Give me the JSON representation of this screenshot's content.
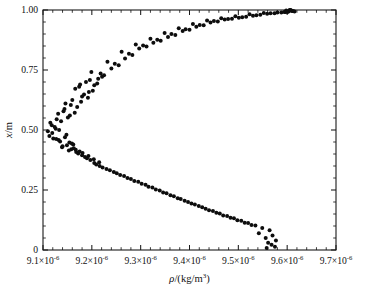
{
  "figure": {
    "width": 365,
    "height": 292,
    "background": "#ffffff",
    "marker_color": "#0d0d0d",
    "axis_color": "#1a1a1a"
  },
  "chart_data": {
    "type": "scatter",
    "title": "",
    "subtitle": "",
    "xlabel": "ρ/(kg/m³)",
    "ylabel": "x/m",
    "xlabel_parts": {
      "symbol": "ρ",
      "slash": "/(kg/m",
      "sup": "3",
      "close": ")"
    },
    "ylabel_parts": {
      "symbol": "x",
      "slash": "/m"
    },
    "grid": false,
    "legend": null,
    "xlim": [
      9.1e-06,
      9.7e-06
    ],
    "ylim": [
      0,
      1.0
    ],
    "xticks": [
      9.1e-06,
      9.2e-06,
      9.3e-06,
      9.4e-06,
      9.5e-06,
      9.6e-06,
      9.7e-06
    ],
    "xticklabels": [
      "9.1×10⁻⁶",
      "9.2×10⁻⁶",
      "9.3×10⁻⁶",
      "9.4×10⁻⁶",
      "9.5×10⁻⁶",
      "9.6×10⁻⁶",
      "9.7×10⁻⁶"
    ],
    "xtick_mantissas": [
      "9.1",
      "9.2",
      "9.3",
      "9.4",
      "9.5",
      "9.6",
      "9.7"
    ],
    "xtick_exponent": "-6",
    "xtick_base": "×10",
    "x_minor_per_major": 5,
    "yticks": [
      0,
      0.25,
      0.5,
      0.75,
      1.0
    ],
    "yticklabels": [
      "0",
      "0.25",
      "0.50",
      "0.75",
      "1.00"
    ],
    "y_minor_per_major": 5,
    "tick_direction": "in",
    "frame": "box",
    "marker": "filled-circle",
    "marker_size_px": 2.0,
    "series": [
      {
        "name": "density profile",
        "x": [
          9.155,
          9.128,
          9.142,
          9.17,
          9.118,
          9.146,
          9.16,
          9.133,
          9.18,
          9.194,
          9.166,
          9.205,
          9.188,
          9.213,
          9.176,
          9.225,
          9.199,
          9.24,
          9.218,
          9.255,
          9.232,
          9.268,
          9.247,
          9.283,
          9.261,
          9.297,
          9.276,
          9.312,
          9.29,
          9.326,
          9.305,
          9.341,
          9.32,
          9.356,
          9.334,
          9.371,
          9.349,
          9.386,
          9.363,
          9.4,
          9.378,
          9.414,
          9.392,
          9.429,
          9.407,
          9.443,
          9.421,
          9.458,
          9.436,
          9.472,
          9.45,
          9.487,
          9.465,
          9.501,
          9.479,
          9.516,
          9.494,
          9.53,
          9.508,
          9.545,
          9.523,
          9.559,
          9.537,
          9.574,
          9.552,
          9.588,
          9.566,
          9.596,
          9.58,
          9.603,
          9.594,
          9.61,
          9.601,
          9.608,
          9.612,
          9.605,
          9.598,
          9.615,
          9.607,
          9.6,
          9.148,
          9.121,
          9.135,
          9.162,
          9.11,
          9.139,
          9.153,
          9.126,
          9.172,
          9.186,
          9.158,
          9.197,
          9.18,
          9.205,
          9.168,
          9.216,
          9.19,
          9.23,
          9.209,
          9.245,
          9.222,
          9.258,
          9.237,
          9.273,
          9.251,
          9.287,
          9.266,
          9.302,
          9.28,
          9.316,
          9.295,
          9.331,
          9.31,
          9.346,
          9.324,
          9.361,
          9.339,
          9.376,
          9.353,
          9.39,
          9.368,
          9.404,
          9.382,
          9.419,
          9.397,
          9.433,
          9.411,
          9.448,
          9.426,
          9.462,
          9.44,
          9.477,
          9.455,
          9.491,
          9.469,
          9.506,
          9.484,
          9.52,
          9.498,
          9.535,
          9.513,
          9.549,
          9.527,
          9.564,
          9.542,
          9.57,
          9.556,
          9.577,
          9.561,
          9.568,
          9.575,
          9.558,
          9.115,
          9.131,
          9.144,
          9.157,
          9.124,
          9.137,
          9.151,
          9.165,
          9.178,
          9.192,
          9.184,
          9.202,
          9.174,
          9.211,
          9.196,
          9.221,
          9.145,
          9.119,
          9.132,
          9.159,
          9.113,
          9.14,
          9.154,
          9.127,
          9.167,
          9.181,
          9.149,
          9.193,
          9.175,
          9.204,
          9.163,
          9.215
        ],
        "y": [
          0.56,
          0.545,
          0.578,
          0.596,
          0.52,
          0.61,
          0.625,
          0.5,
          0.64,
          0.658,
          0.672,
          0.686,
          0.7,
          0.714,
          0.69,
          0.728,
          0.742,
          0.756,
          0.735,
          0.77,
          0.784,
          0.798,
          0.776,
          0.812,
          0.826,
          0.84,
          0.818,
          0.848,
          0.856,
          0.864,
          0.852,
          0.872,
          0.88,
          0.888,
          0.876,
          0.896,
          0.904,
          0.912,
          0.9,
          0.918,
          0.924,
          0.93,
          0.92,
          0.936,
          0.942,
          0.948,
          0.938,
          0.952,
          0.956,
          0.96,
          0.954,
          0.964,
          0.966,
          0.968,
          0.962,
          0.972,
          0.974,
          0.976,
          0.97,
          0.98,
          0.982,
          0.984,
          0.978,
          0.986,
          0.988,
          0.99,
          0.986,
          0.992,
          0.99,
          0.994,
          0.992,
          0.996,
          0.994,
          0.998,
          0.996,
          1.0,
          0.998,
          0.994,
          1.0,
          0.992,
          0.48,
          0.465,
          0.452,
          0.44,
          0.495,
          0.428,
          0.415,
          0.505,
          0.402,
          0.388,
          0.42,
          0.375,
          0.395,
          0.362,
          0.408,
          0.35,
          0.382,
          0.338,
          0.356,
          0.325,
          0.344,
          0.312,
          0.332,
          0.3,
          0.32,
          0.288,
          0.308,
          0.276,
          0.296,
          0.264,
          0.284,
          0.252,
          0.272,
          0.24,
          0.26,
          0.228,
          0.248,
          0.216,
          0.236,
          0.205,
          0.224,
          0.194,
          0.212,
          0.183,
          0.2,
          0.172,
          0.19,
          0.162,
          0.178,
          0.152,
          0.166,
          0.142,
          0.155,
          0.132,
          0.144,
          0.122,
          0.134,
          0.112,
          0.124,
          0.102,
          0.114,
          0.092,
          0.104,
          0.082,
          0.07,
          0.06,
          0.05,
          0.04,
          0.03,
          0.022,
          0.014,
          0.008,
          0.53,
          0.568,
          0.588,
          0.604,
          0.512,
          0.536,
          0.552,
          0.572,
          0.618,
          0.634,
          0.648,
          0.664,
          0.68,
          0.694,
          0.708,
          0.722,
          0.47,
          0.488,
          0.458,
          0.444,
          0.475,
          0.432,
          0.448,
          0.462,
          0.418,
          0.404,
          0.436,
          0.392,
          0.41,
          0.378,
          0.424,
          0.366
        ],
        "x_scale": 1e-06,
        "count": 184
      }
    ]
  },
  "layout": {
    "plot_left": 43,
    "plot_right": 336,
    "plot_top": 10,
    "plot_bottom": 250
  }
}
